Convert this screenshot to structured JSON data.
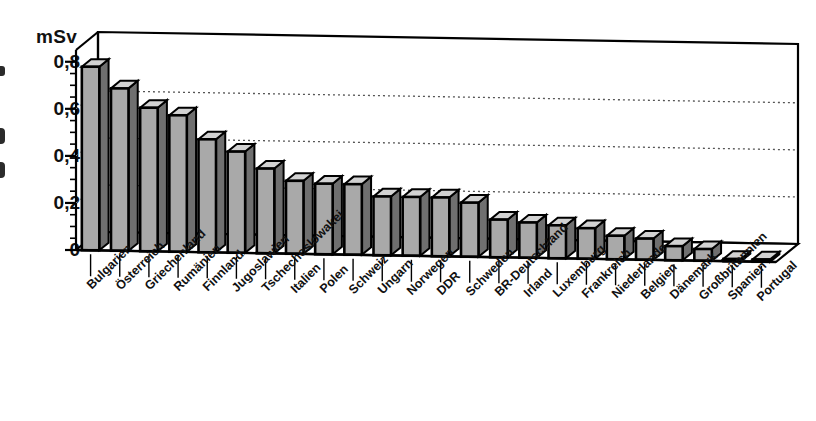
{
  "chart_data": {
    "type": "bar",
    "title": "",
    "subtitle": "",
    "xlabel": "",
    "ylabel": "mSv",
    "unit_caption": "mSv",
    "ylim": [
      0,
      0.85
    ],
    "yticks": [
      0,
      0.2,
      0.4,
      0.6,
      0.8
    ],
    "ytick_labels": [
      "0",
      "0,2",
      "0,4",
      "0,6",
      "0,8"
    ],
    "minor_tick_step": 0.05,
    "gridlines": [
      0.2,
      0.4,
      0.6
    ],
    "grid": "horizontal-dotted",
    "legend": "none",
    "style": "3d-pseudo",
    "bar_fill_color": "#a9a9a9",
    "bar_edge_color": "#000000",
    "categories": [
      "Bulgarien",
      "Österreich",
      "Griechenland",
      "Rumänien",
      "Finnland",
      "Jugoslawien",
      "Tschechoslowakei",
      "Italien",
      "Polen",
      "Schweiz",
      "Ungarn",
      "Norwegen",
      "DDR",
      "Schweden",
      "BR-Deutschland",
      "Irland",
      "Luxemburg",
      "Frankreich",
      "Niederlande",
      "Belgien",
      "Dänemark",
      "Großbritannien",
      "Spanien",
      "Portugal"
    ],
    "values": [
      0.78,
      0.69,
      0.61,
      0.58,
      0.48,
      0.43,
      0.36,
      0.31,
      0.3,
      0.3,
      0.25,
      0.25,
      0.25,
      0.23,
      0.16,
      0.15,
      0.14,
      0.13,
      0.1,
      0.09,
      0.06,
      0.05,
      0.01,
      0.01
    ]
  },
  "axis": {
    "unit_label": "mSv"
  }
}
